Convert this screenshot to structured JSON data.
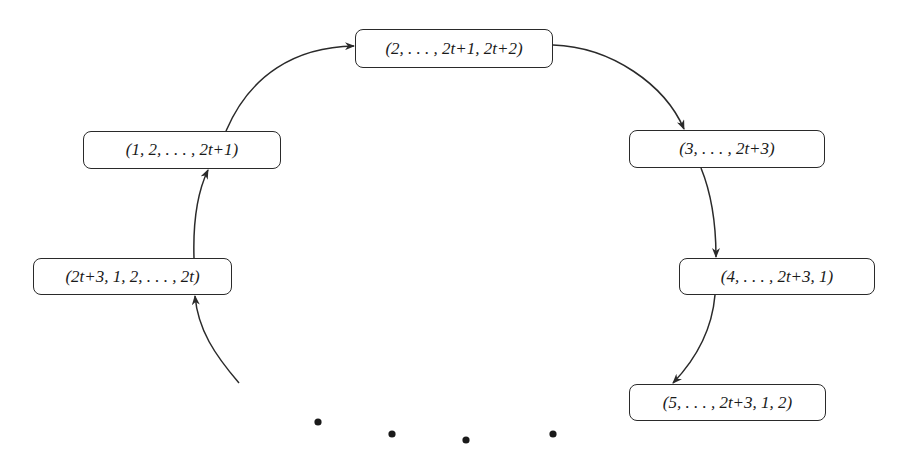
{
  "diagram": {
    "type": "cyclic-sequence",
    "nodes": [
      {
        "id": "n0",
        "label": "(2, . . . , 2t+1, 2t+2)"
      },
      {
        "id": "n1",
        "label": "(3, . . . , 2t+3)"
      },
      {
        "id": "n2",
        "label": "(4, . . . , 2t+3, 1)"
      },
      {
        "id": "n3",
        "label": "(5, . . . , 2t+3, 1, 2)"
      },
      {
        "id": "n4",
        "label": "(2t+3, 1, 2, . . . , 2t)"
      },
      {
        "id": "n5",
        "label": "(1, 2, . . . , 2t+1)"
      }
    ],
    "edges": [
      {
        "from": "n5",
        "to": "n0"
      },
      {
        "from": "n0",
        "to": "n1"
      },
      {
        "from": "n1",
        "to": "n2"
      },
      {
        "from": "n2",
        "to": "n3"
      },
      {
        "from": "n4",
        "to": "n5"
      },
      {
        "from": "continuation",
        "to": "n4"
      }
    ],
    "continuation_dots": 4,
    "colors": {
      "stroke": "#2a2a2a",
      "text": "#1a1a1a",
      "background": "#ffffff"
    }
  }
}
